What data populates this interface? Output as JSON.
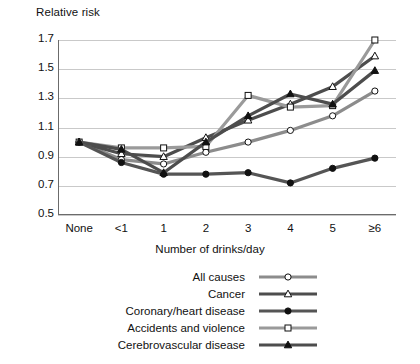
{
  "chart_data": {
    "type": "line",
    "title": "",
    "ylabel": "Relative risk",
    "xlabel": "Number of drinks/day",
    "categories": [
      "None",
      "<1",
      "1",
      "2",
      "3",
      "4",
      "5",
      "≥6"
    ],
    "yticks": [
      0.5,
      0.7,
      0.9,
      1.1,
      1.3,
      1.5,
      1.7
    ],
    "ytick_labels": [
      "0.5",
      "0.7",
      "0.9",
      "1.1",
      "1.3",
      "1.5",
      "1.7"
    ],
    "ylim": [
      0.5,
      1.7
    ],
    "grid": true,
    "legend_position": "bottom",
    "series": [
      {
        "name": "All causes",
        "marker": "open-circle",
        "color": "#8c8c8c",
        "values": [
          1.0,
          0.88,
          0.85,
          0.93,
          1.0,
          1.08,
          1.18,
          1.35
        ]
      },
      {
        "name": "Cancer",
        "marker": "open-triangle",
        "color": "#4d4d4d",
        "values": [
          1.0,
          0.92,
          0.9,
          1.03,
          1.15,
          1.26,
          1.38,
          1.59
        ]
      },
      {
        "name": "Coronary/heart disease",
        "marker": "filled-circle",
        "color": "#555555",
        "values": [
          1.0,
          0.86,
          0.78,
          0.78,
          0.79,
          0.72,
          0.82,
          0.89
        ]
      },
      {
        "name": "Accidents and violence",
        "marker": "open-square",
        "color": "#9a9a9a",
        "values": [
          1.0,
          0.96,
          0.96,
          0.97,
          1.32,
          1.24,
          1.25,
          1.7
        ]
      },
      {
        "name": "Cerebrovascular disease",
        "marker": "filled-triangle",
        "color": "#4d4d4d",
        "values": [
          1.0,
          0.95,
          0.79,
          1.0,
          1.18,
          1.33,
          1.26,
          1.49
        ]
      }
    ]
  }
}
